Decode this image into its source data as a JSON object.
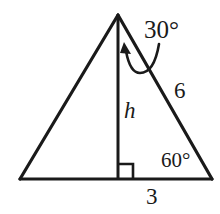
{
  "figure": {
    "stroke_color": "#1a1a1a",
    "background_color": "#ffffff",
    "labels": {
      "apex_angle": "30°",
      "base_angle": "60°",
      "hypotenuse": "6",
      "base_segment": "3",
      "height": "h"
    },
    "geometry": {
      "apex": [
        118,
        15
      ],
      "bottom_left": [
        20,
        179
      ],
      "bottom_right": [
        212,
        179
      ],
      "altitude_foot": [
        118,
        179
      ],
      "right_angle_marker": [
        118,
        165,
        14,
        14
      ]
    }
  }
}
